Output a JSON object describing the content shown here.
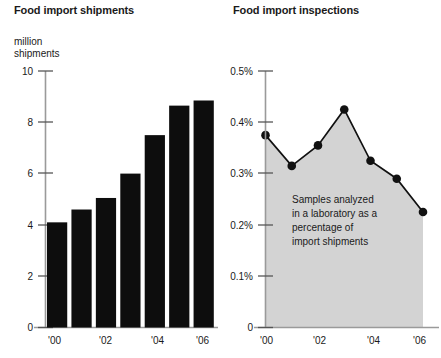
{
  "left": {
    "title": "Food import shipments",
    "unit_label_line1": "million",
    "unit_label_line2": "shipments",
    "y_ticks": [
      "10",
      "8",
      "6",
      "4",
      "2",
      "0"
    ],
    "x_ticks": [
      "'00",
      "'02",
      "'04",
      "'06"
    ]
  },
  "right": {
    "title": "Food import inspections",
    "y_ticks": [
      "0.5%",
      "0.4%",
      "0.3%",
      "0.2%",
      "0.1%",
      "0"
    ],
    "x_ticks": [
      "'00",
      "'02",
      "'04",
      "'06"
    ],
    "annotation": [
      "Samples analyzed",
      "in a laboratory as a",
      "percentage of",
      "import shipments"
    ]
  },
  "colors": {
    "bar": "#0d0d0d",
    "area": "#d3d3d3",
    "line": "#111111",
    "axis": "#9a9a9a",
    "text": "#1a1a1a"
  },
  "chart_data": [
    {
      "type": "bar",
      "title": "Food import shipments",
      "xlabel": "",
      "ylabel": "million shipments",
      "categories": [
        "'00",
        "'01",
        "'02",
        "'03",
        "'04",
        "'05",
        "'06"
      ],
      "values": [
        4.1,
        4.6,
        5.05,
        6.0,
        7.5,
        8.65,
        8.85
      ],
      "ylim": [
        0,
        10
      ],
      "ytick_values": [
        10,
        8,
        6,
        4,
        2,
        0
      ],
      "xtick_labels": [
        "'00",
        "'02",
        "'04",
        "'06"
      ],
      "grid": false,
      "legend": "none"
    },
    {
      "type": "area",
      "title": "Food import inspections",
      "xlabel": "",
      "ylabel": "percent",
      "categories": [
        "'00",
        "'01",
        "'02",
        "'03",
        "'04",
        "'05",
        "'06"
      ],
      "values": [
        0.375,
        0.315,
        0.355,
        0.425,
        0.325,
        0.29,
        0.225
      ],
      "ylim": [
        0,
        0.5
      ],
      "ytick_values": [
        0.5,
        0.4,
        0.3,
        0.2,
        0.1,
        0
      ],
      "ytick_labels": [
        "0.5%",
        "0.4%",
        "0.3%",
        "0.2%",
        "0.1%",
        "0"
      ],
      "xtick_labels": [
        "'00",
        "'02",
        "'04",
        "'06"
      ],
      "annotation": "Samples analyzed in a laboratory as a percentage of import shipments",
      "grid": false,
      "legend": "none",
      "markers": true
    }
  ]
}
